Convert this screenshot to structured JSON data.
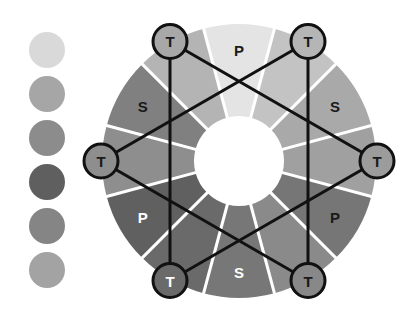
{
  "swatches": [
    {
      "color": "#d9d9d9"
    },
    {
      "color": "#a6a6a6"
    },
    {
      "color": "#8c8c8c"
    },
    {
      "color": "#5f5f5f"
    },
    {
      "color": "#858585"
    },
    {
      "color": "#a3a3a3"
    }
  ],
  "wheel": {
    "center": [
      239,
      161
    ],
    "outer_radius": 137,
    "inner_radius": 45,
    "segments": [
      {
        "label": "P",
        "angle": -90,
        "color": "#e4e4e4",
        "text_color": "#1a1a1a"
      },
      {
        "label": "",
        "angle": -60,
        "color": "#c3c3c3",
        "text_color": "#1a1a1a"
      },
      {
        "label": "S",
        "angle": -30,
        "color": "#a9a9a9",
        "text_color": "#1a1a1a"
      },
      {
        "label": "",
        "angle": 0,
        "color": "#a0a0a0",
        "text_color": "#1a1a1a"
      },
      {
        "label": "P",
        "angle": 30,
        "color": "#767676",
        "text_color": "#1a1a1a"
      },
      {
        "label": "",
        "angle": 60,
        "color": "#8a8a8a",
        "text_color": "#1a1a1a"
      },
      {
        "label": "S",
        "angle": 90,
        "color": "#777777",
        "text_color": "#ffffff"
      },
      {
        "label": "",
        "angle": 120,
        "color": "#6a6a6a",
        "text_color": "#ffffff"
      },
      {
        "label": "P",
        "angle": 150,
        "color": "#606060",
        "text_color": "#ffffff"
      },
      {
        "label": "",
        "angle": 180,
        "color": "#8e8e8e",
        "text_color": "#1a1a1a"
      },
      {
        "label": "S",
        "angle": -150,
        "color": "#808080",
        "text_color": "#1a1a1a"
      },
      {
        "label": "",
        "angle": -120,
        "color": "#b4b4b4",
        "text_color": "#1a1a1a"
      }
    ]
  },
  "tertiary_markers": [
    {
      "id": "top-left",
      "label": "T",
      "angle": -120,
      "fill": "#a8a8a8",
      "text_color": "#1a1a1a"
    },
    {
      "id": "top-right",
      "label": "T",
      "angle": -60,
      "fill": "#b5b5b5",
      "text_color": "#1a1a1a"
    },
    {
      "id": "right",
      "label": "T",
      "angle": 0,
      "fill": "#9c9c9c",
      "text_color": "#1a1a1a"
    },
    {
      "id": "bottom-right",
      "label": "T",
      "angle": 60,
      "fill": "#888888",
      "text_color": "#1a1a1a"
    },
    {
      "id": "bottom-left",
      "label": "T",
      "angle": 120,
      "fill": "#6a6a6a",
      "text_color": "#ffffff"
    },
    {
      "id": "left",
      "label": "T",
      "angle": 180,
      "fill": "#8e8e8e",
      "text_color": "#1a1a1a"
    }
  ],
  "triangles": [
    [
      "top-left",
      "right",
      "bottom-left"
    ],
    [
      "top-right",
      "left",
      "bottom-right"
    ]
  ],
  "colors": {
    "separator": "#ffffff",
    "outline": "#111111"
  }
}
